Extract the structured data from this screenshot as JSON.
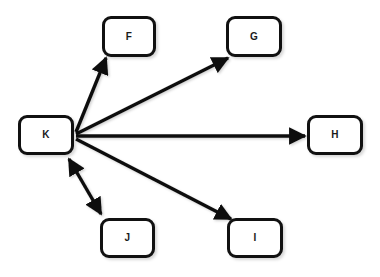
{
  "diagram": {
    "background_color": "#ffffff",
    "node_fill": "#ffffff",
    "node_stroke": "#111111",
    "edge_color": "#111111",
    "nodes": [
      {
        "id": "K",
        "label": "K",
        "x": 18,
        "y": 115,
        "w": 56,
        "h": 40
      },
      {
        "id": "F",
        "label": "F",
        "x": 102,
        "y": 16,
        "w": 54,
        "h": 41
      },
      {
        "id": "G",
        "label": "G",
        "x": 226,
        "y": 16,
        "w": 56,
        "h": 41
      },
      {
        "id": "H",
        "label": "H",
        "x": 307,
        "y": 115,
        "w": 56,
        "h": 40
      },
      {
        "id": "I",
        "label": "I",
        "x": 227,
        "y": 218,
        "w": 56,
        "h": 40
      },
      {
        "id": "J",
        "label": "J",
        "x": 100,
        "y": 218,
        "w": 55,
        "h": 40
      }
    ],
    "edges": [
      {
        "id": "K-F",
        "from": "K",
        "to": "F",
        "direction": "one-way",
        "x1": 76,
        "y1": 132,
        "x2": 106,
        "y2": 58
      },
      {
        "id": "K-G",
        "from": "K",
        "to": "G",
        "direction": "one-way",
        "x1": 76,
        "y1": 134,
        "x2": 228,
        "y2": 58
      },
      {
        "id": "K-H",
        "from": "K",
        "to": "H",
        "direction": "one-way",
        "x1": 76,
        "y1": 136,
        "x2": 305,
        "y2": 136
      },
      {
        "id": "K-I",
        "from": "K",
        "to": "I",
        "direction": "one-way",
        "x1": 76,
        "y1": 139,
        "x2": 231,
        "y2": 219
      },
      {
        "id": "K-J",
        "from": "K",
        "to": "J",
        "direction": "two-way",
        "x1": 68,
        "y1": 158,
        "x2": 100,
        "y2": 215
      }
    ]
  }
}
